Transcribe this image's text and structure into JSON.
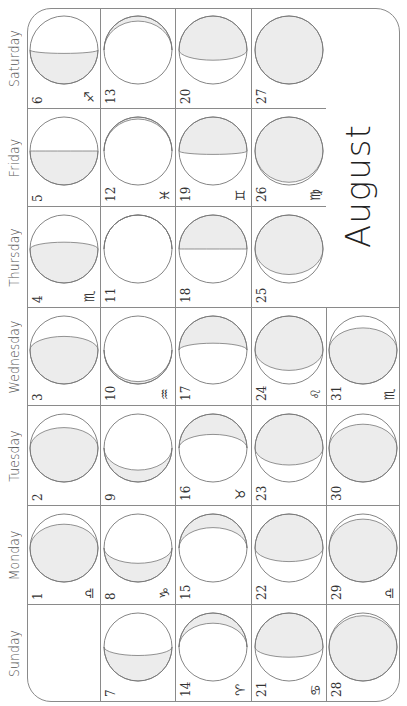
{
  "title": "August",
  "day_names": [
    "Sunday",
    "Monday",
    "Tuesday",
    "Wednesday",
    "Thursday",
    "Friday",
    "Saturday"
  ],
  "colors": {
    "shade": "#ececec",
    "line": "#8a8a8a",
    "moon_stroke": "#777777"
  },
  "weeks": [
    [
      null,
      {
        "day": "1",
        "zodiac": "♎",
        "side": "left",
        "e": -0.7
      },
      {
        "day": "2",
        "zodiac": "",
        "side": "left",
        "e": -0.6
      },
      {
        "day": "3",
        "zodiac": "",
        "side": "left",
        "e": -0.4
      },
      {
        "day": "4",
        "zodiac": "♏",
        "side": "left",
        "e": -0.2
      },
      {
        "day": "5",
        "zodiac": "",
        "side": "left",
        "e": 0
      },
      {
        "day": "6",
        "zodiac": "♐",
        "side": "left",
        "e": 0.1
      }
    ],
    [
      {
        "day": "7",
        "zodiac": "",
        "side": "left",
        "e": 0.25
      },
      {
        "day": "8",
        "zodiac": "♑",
        "side": "left",
        "e": 0.45
      },
      {
        "day": "9",
        "zodiac": "",
        "side": "left",
        "e": 0.65
      },
      {
        "day": "10",
        "zodiac": "♒",
        "side": "left",
        "e": 0.93
      },
      {
        "day": "11",
        "zodiac": "",
        "side": "right",
        "e": -1
      },
      {
        "day": "12",
        "zodiac": "♓",
        "side": "right",
        "e": -0.94
      },
      {
        "day": "13",
        "zodiac": "",
        "side": "right",
        "e": -0.85
      }
    ],
    [
      {
        "day": "14",
        "zodiac": "♈",
        "side": "right",
        "e": -0.7
      },
      {
        "day": "15",
        "zodiac": "",
        "side": "right",
        "e": -0.6
      },
      {
        "day": "16",
        "zodiac": "♉",
        "side": "right",
        "e": -0.4
      },
      {
        "day": "17",
        "zodiac": "",
        "side": "right",
        "e": -0.2
      },
      {
        "day": "18",
        "zodiac": "",
        "side": "right",
        "e": 0
      },
      {
        "day": "19",
        "zodiac": "♊",
        "side": "right",
        "e": 0.1
      },
      {
        "day": "20",
        "zodiac": "",
        "side": "right",
        "e": 0.3
      }
    ],
    [
      {
        "day": "21",
        "zodiac": "♋",
        "side": "right",
        "e": 0.3
      },
      {
        "day": "22",
        "zodiac": "",
        "side": "right",
        "e": 0.4
      },
      {
        "day": "23",
        "zodiac": "",
        "side": "right",
        "e": 0.5
      },
      {
        "day": "24",
        "zodiac": "♌",
        "side": "right",
        "e": 0.6
      },
      {
        "day": "25",
        "zodiac": "",
        "side": "right",
        "e": 0.75
      },
      {
        "day": "26",
        "zodiac": "♍",
        "side": "right",
        "e": 0.92
      },
      {
        "day": "27",
        "zodiac": "",
        "side": "right",
        "e": 1
      }
    ],
    [
      {
        "day": "28",
        "zodiac": "",
        "side": "left",
        "e": -0.92
      },
      {
        "day": "29",
        "zodiac": "♎",
        "side": "left",
        "e": -0.85
      },
      {
        "day": "30",
        "zodiac": "",
        "side": "left",
        "e": -0.7
      },
      {
        "day": "31",
        "zodiac": "♏",
        "side": "left",
        "e": -0.65
      }
    ]
  ]
}
